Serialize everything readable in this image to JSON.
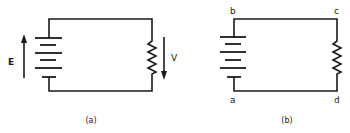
{
  "diagram": {
    "type": "circuit-schematic",
    "colors": {
      "line": "#1a1a1a",
      "background": "#ffffff"
    },
    "panels": [
      {
        "id": "a",
        "caption": "(a)",
        "components": [
          "battery",
          "resistor"
        ],
        "labels": {
          "emf": "E",
          "voltage": "V"
        },
        "arrows": [
          {
            "label": "E",
            "direction": "up",
            "beside": "battery"
          },
          {
            "label": "V",
            "direction": "down",
            "beside": "resistor"
          }
        ]
      },
      {
        "id": "b",
        "caption": "(b)",
        "components": [
          "battery",
          "resistor"
        ],
        "nodes": {
          "top_left": "b",
          "top_right": "c",
          "bottom_left": "a",
          "bottom_right": "d"
        }
      }
    ]
  }
}
